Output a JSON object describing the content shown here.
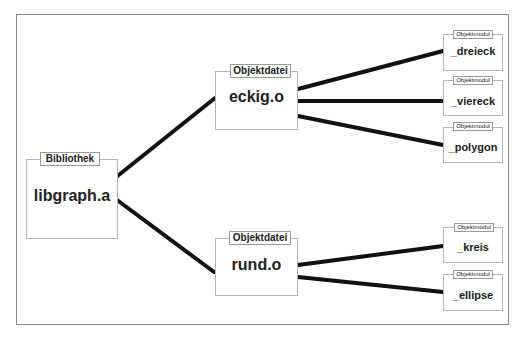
{
  "diagram": {
    "root": {
      "tab": "Bibliothek",
      "name": "libgraph.a"
    },
    "objects": [
      {
        "tab": "Objektdatei",
        "name": "eckig.o",
        "modules": [
          {
            "tab": "Objektmodul",
            "name": "_dreieck"
          },
          {
            "tab": "Objektmodul",
            "name": "_viereck"
          },
          {
            "tab": "Objektmodul",
            "name": "_polygon"
          }
        ]
      },
      {
        "tab": "Objektdatei",
        "name": "rund.o",
        "modules": [
          {
            "tab": "Objektmodul",
            "name": "_kreis"
          },
          {
            "tab": "Objektmodul",
            "name": "_ellipse"
          }
        ]
      }
    ],
    "colors": {
      "line": "#111111",
      "box_border": "#b5b5b5",
      "frame": "#8a8a8a"
    }
  }
}
